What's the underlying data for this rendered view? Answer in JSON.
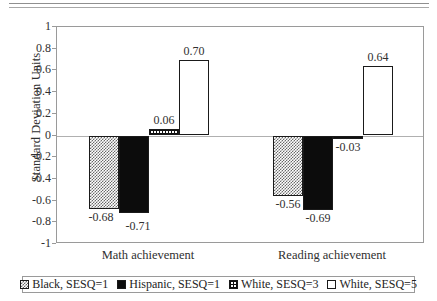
{
  "top_rule": {
    "present": true,
    "style": "double-horizontal-rule"
  },
  "chart_data": {
    "type": "bar",
    "title": "",
    "subtitle": "",
    "xlabel": "",
    "ylabel": "Standard Deviation Units",
    "ylim": [
      -1,
      1
    ],
    "ytick_step": 0.2,
    "ytick_labels": [
      "1",
      "0.8",
      "0.6",
      "0.4",
      "0.2",
      "0",
      "-0.2",
      "-0.4",
      "-0.6",
      "-0.8",
      "-1"
    ],
    "ytick_values": [
      1,
      0.8,
      0.6,
      0.4,
      0.2,
      0,
      -0.2,
      -0.4,
      -0.6,
      -0.8,
      -1
    ],
    "grid": false,
    "legend_position": "bottom",
    "categories": [
      "Math achievement",
      "Reading achievement"
    ],
    "series": [
      {
        "name": "Black, SESQ=1",
        "pattern": "checker-light",
        "values": [
          -0.68,
          -0.56
        ],
        "labels": [
          "-0.68",
          "-0.56"
        ]
      },
      {
        "name": "Hispanic, SESQ=1",
        "pattern": "solid",
        "values": [
          -0.71,
          -0.69
        ],
        "labels": [
          "-0.71",
          "-0.69"
        ]
      },
      {
        "name": "White, SESQ=3",
        "pattern": "grid",
        "values": [
          0.06,
          -0.03
        ],
        "labels": [
          "0.06",
          "-0.03"
        ]
      },
      {
        "name": "White, SESQ=5",
        "pattern": "open",
        "values": [
          0.7,
          0.64
        ],
        "labels": [
          "0.70",
          "0.64"
        ]
      }
    ]
  },
  "axis": {
    "y_title": "Standard Deviation Units",
    "ticks": [
      {
        "label": "1",
        "value": 1
      },
      {
        "label": "0.8",
        "value": 0.8
      },
      {
        "label": "0.6",
        "value": 0.6
      },
      {
        "label": "0.4",
        "value": 0.4
      },
      {
        "label": "0.2",
        "value": 0.2
      },
      {
        "label": "0",
        "value": 0
      },
      {
        "label": "-0.2",
        "value": -0.2
      },
      {
        "label": "-0.4",
        "value": -0.4
      },
      {
        "label": "-0.6",
        "value": -0.6
      },
      {
        "label": "-0.8",
        "value": -0.8
      },
      {
        "label": "-1",
        "value": -1
      }
    ],
    "categories": [
      "Math achievement",
      "Reading achievement"
    ]
  },
  "legend": {
    "items": [
      {
        "label": "Black, SESQ=1",
        "pattern": "checker-light"
      },
      {
        "label": "Hispanic, SESQ=1",
        "pattern": "solid"
      },
      {
        "label": "White, SESQ=3",
        "pattern": "grid"
      },
      {
        "label": "White, SESQ=5",
        "pattern": "open"
      }
    ]
  },
  "colors": {
    "frame": "#9a9a9a",
    "bar_outline": "#1a1a1a",
    "solid_fill": "#0c0c0c",
    "text": "#303030",
    "background": "#ffffff"
  }
}
